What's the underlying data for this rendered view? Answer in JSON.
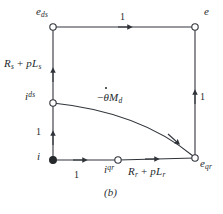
{
  "figure": {
    "caption": "(b)",
    "type": "signal-flow-graph",
    "stroke_color": "#30343a",
    "background": "#ffffff"
  },
  "nodes": [
    {
      "id": "e_ds",
      "label_html": "e",
      "sub": "ds",
      "sup": "",
      "x": 53,
      "y": 27,
      "filled": false,
      "label_x": 38,
      "label_y": 9
    },
    {
      "id": "e",
      "label_html": "e",
      "sub": "",
      "sup": "",
      "x": 195,
      "y": 27,
      "filled": false,
      "label_x": 203,
      "label_y": 9
    },
    {
      "id": "i_ds",
      "label_html": "i",
      "sub": "",
      "sup": "ds",
      "x": 53,
      "y": 103,
      "filled": false,
      "label_x": 26,
      "label_y": 93
    },
    {
      "id": "i",
      "label_html": "i",
      "sub": "",
      "sup": "",
      "x": 53,
      "y": 160,
      "filled": true,
      "label_x": 38,
      "label_y": 152
    },
    {
      "id": "i_qr",
      "label_html": "i",
      "sub": "",
      "sup": "qr",
      "x": 118,
      "y": 160,
      "filled": false,
      "label_x": 104,
      "label_y": 164
    },
    {
      "id": "e_qr",
      "label_html": "e",
      "sub": "qr",
      "sup": "",
      "x": 195,
      "y": 158,
      "filled": false,
      "label_x": 200,
      "label_y": 160
    }
  ],
  "edges": [
    {
      "id": "top",
      "from": "e_ds",
      "to": "e",
      "gain": "1"
    },
    {
      "id": "right",
      "from": "e_qr",
      "to": "e",
      "gain": "1"
    },
    {
      "id": "left-upper",
      "from": "i_ds",
      "to": "e_ds",
      "gain_text": "R_s + pL_s"
    },
    {
      "id": "left-lower",
      "from": "i",
      "to": "i_ds",
      "gain": "1"
    },
    {
      "id": "bottom-left",
      "from": "i",
      "to": "i_qr",
      "gain": "1"
    },
    {
      "id": "bottom-right",
      "from": "i_qr",
      "to": "e_qr",
      "gain_text": "R_r + pL_r"
    },
    {
      "id": "curve",
      "from": "i_ds",
      "to": "e_qr",
      "gain_text": "-theta-dot M_d"
    }
  ],
  "labels": {
    "top_gain": "1",
    "right_gain": "1",
    "left_lower_gain": "1",
    "bottom_left_gain": "1",
    "stator_impedance": {
      "R": "R",
      "R_sub": "s",
      "plus": "+",
      "p": "p",
      "L": "L",
      "L_sub": "s"
    },
    "rotor_impedance": {
      "R": "R",
      "R_sub": "r",
      "plus": "+",
      "p": "p",
      "L": "L",
      "L_sub": "r"
    },
    "coupling": {
      "minus": "−",
      "theta": "θ",
      "M": "M",
      "M_sub": "d"
    },
    "node_e_ds": {
      "base": "e",
      "sub": "ds"
    },
    "node_e": {
      "base": "e"
    },
    "node_i_ds": {
      "base": "i",
      "sup": "ds"
    },
    "node_i": {
      "base": "i"
    },
    "node_i_qr": {
      "base": "i",
      "sup": "qr"
    },
    "node_e_qr": {
      "base": "e",
      "sub": "qr"
    }
  }
}
